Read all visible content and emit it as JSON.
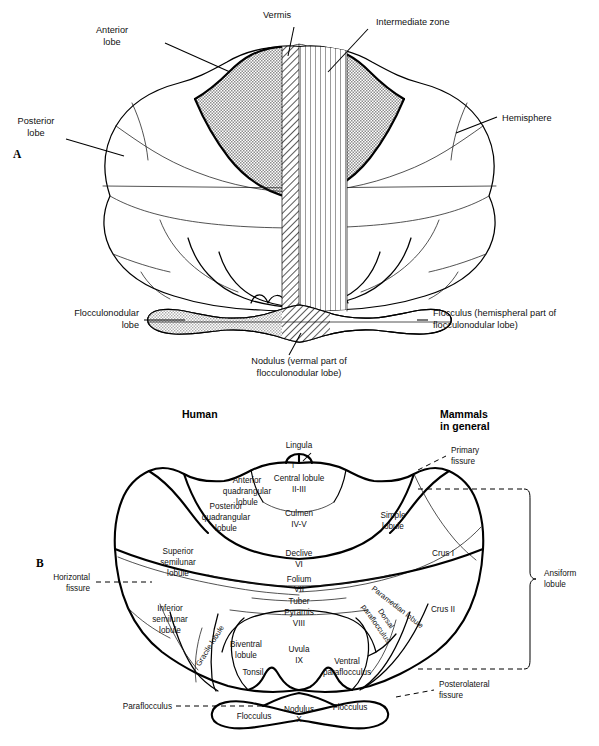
{
  "figure": {
    "panels": [
      {
        "id": "A",
        "letter": "A"
      },
      {
        "id": "B",
        "letter": "B"
      }
    ]
  },
  "panel_a": {
    "letter": "A",
    "labels": {
      "anterior_lobe_line1": "Anterior",
      "anterior_lobe_line2": "lobe",
      "vermis": "Vermis",
      "intermediate_zone": "Intermediate zone",
      "hemisphere": "Hemisphere",
      "posterior_lobe_line1": "Posterior",
      "posterior_lobe_line2": "lobe",
      "flocculonodular_lobe_line1": "Flocculonodular",
      "flocculonodular_lobe_line2": "lobe",
      "flocculus_line1": "Flocculus (hemispheral part of",
      "flocculus_line2": "flocculonodular lobe)",
      "nodulus_line1": "Nodulus (vermal part of",
      "nodulus_line2": "flocculonodular lobe)"
    }
  },
  "panel_b": {
    "letter": "B",
    "headings": {
      "left": "Human",
      "right_line1": "Mammals",
      "right_line2": "in general"
    },
    "human_labels": {
      "lingula": "Lingula",
      "lingula_roman": "I",
      "central_lobule": "Central lobule",
      "central_lobule_roman": "II-III",
      "anterior_quadrangular_line1": "Anterior",
      "anterior_quadrangular_line2": "quadrangular",
      "anterior_quadrangular_line3": "lobule",
      "posterior_quadrangular_line1": "Posterior",
      "posterior_quadrangular_line2": "quadrangular",
      "posterior_quadrangular_line3": "lobule",
      "culmen": "Culmen",
      "culmen_roman": "IV-V",
      "declive": "Declive",
      "declive_roman": "VI",
      "folium": "Folium",
      "folium_roman": "VII",
      "tuber": "Tuber",
      "pyramis": "Pyramis",
      "pyramis_roman": "VIII",
      "uvula": "Uvula",
      "uvula_roman": "IX",
      "nodulus": "Nodulus",
      "nodulus_roman": "X",
      "superior_semilunar_line1": "Superior",
      "superior_semilunar_line2": "semilunar",
      "superior_semilunar_line3": "lobule",
      "inferior_semilunar_line1": "Inferior",
      "inferior_semilunar_line2": "semilunar",
      "inferior_semilunar_line3": "lobule",
      "gracile_lobule": "Gracile lobule",
      "biventral_line1": "Biventral",
      "biventral_line2": "lobule",
      "tonsil": "Tonsil",
      "flocculus_left": "Flocculus",
      "flocculus_right": "Flocculus"
    },
    "mammal_labels": {
      "simple_lobule_line1": "Simple",
      "simple_lobule_line2": "lobule",
      "crus_i": "Crus I",
      "crus_ii": "Crus II",
      "paramedian_lobule": "Paramedian lobule",
      "dorsal_paraflocculus_line1": "Dorsal",
      "dorsal_paraflocculus_line2": "paraflocculus",
      "ventral_paraflocculus_line1": "Ventral",
      "ventral_paraflocculus_line2": "paraflocculus",
      "ansiform_lobule_line1": "Ansiform",
      "ansiform_lobule_line2": "lobule",
      "paraflocculus": "Paraflocculus"
    },
    "fissure_labels": {
      "primary_line1": "Primary",
      "primary_line2": "fissure",
      "horizontal_line1": "Horizontal",
      "horizontal_line2": "fissure",
      "posterolateral_line1": "Posterolateral",
      "posterolateral_line2": "fissure"
    }
  },
  "colors": {
    "ink": "#000000",
    "anterior_lobe_fill": "#b8b8b8",
    "flocculonodular_fill": "#cfcfcf",
    "page_background": "#ffffff"
  }
}
